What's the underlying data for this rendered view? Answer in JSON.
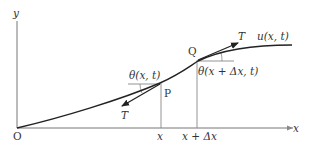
{
  "diagram": {
    "axes": {
      "x_label": "x",
      "y_label": "y",
      "origin_label": "O"
    },
    "curve": {
      "label": "u(x, t)"
    },
    "points": {
      "P": {
        "label": "P",
        "x_tick": "x",
        "angle_label": "θ(x, t)",
        "tension_label": "T"
      },
      "Q": {
        "label": "Q",
        "x_tick": "x + Δx",
        "angle_label": "θ(x + Δx, t)",
        "tension_label": "T"
      }
    },
    "colors": {
      "stroke": "#222222",
      "thin": "#777777",
      "text": "#333333"
    }
  }
}
